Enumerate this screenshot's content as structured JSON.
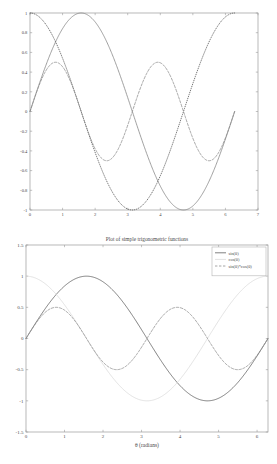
{
  "chart_data": [
    {
      "id": "top-plot",
      "type": "line",
      "title": "",
      "xlabel": "",
      "ylabel": "",
      "xlim": [
        0,
        7
      ],
      "ylim": [
        -1,
        1
      ],
      "xticks": [
        "0",
        "1",
        "2",
        "3",
        "4",
        "5",
        "6",
        "7"
      ],
      "xtick_values": [
        0,
        1,
        2,
        3,
        4,
        5,
        6,
        7
      ],
      "yticks": [
        "1",
        "0.8",
        "0.6",
        "0.4",
        "0.2",
        "0",
        "-0.2",
        "-0.4",
        "-0.6",
        "-0.8",
        "-1"
      ],
      "ytick_values": [
        1,
        0.8,
        0.6,
        0.4,
        0.2,
        0,
        -0.2,
        -0.4,
        -0.6,
        -0.8,
        -1
      ],
      "grid": false,
      "legend": false,
      "x_domain_data": [
        0,
        6.2832
      ],
      "series": [
        {
          "name": "sin(theta)",
          "style": "solid",
          "color": "#808080",
          "expression": "sin(x)",
          "amplitude": 1,
          "samples_x": [
            0,
            0.3927,
            0.7854,
            1.1781,
            1.5708,
            1.9635,
            2.3562,
            2.7489,
            3.1416,
            3.5343,
            3.927,
            4.3197,
            4.7124,
            5.1051,
            5.4978,
            5.8905,
            6.2832
          ],
          "samples_y": [
            0,
            0.3827,
            0.7071,
            0.9239,
            1,
            0.9239,
            0.7071,
            0.3827,
            0,
            -0.3827,
            -0.7071,
            -0.9239,
            -1,
            -0.9239,
            -0.7071,
            -0.3827,
            0
          ]
        },
        {
          "name": "cos(theta)",
          "style": "dotted",
          "color": "#4a4a4a",
          "expression": "cos(x)",
          "amplitude": 1,
          "samples_x": [
            0,
            0.3927,
            0.7854,
            1.1781,
            1.5708,
            1.9635,
            2.3562,
            2.7489,
            3.1416,
            3.5343,
            3.927,
            4.3197,
            4.7124,
            5.1051,
            5.4978,
            5.8905,
            6.2832
          ],
          "samples_y": [
            1,
            0.9239,
            0.7071,
            0.3827,
            0,
            -0.3827,
            -0.7071,
            -0.9239,
            -1,
            -0.9239,
            -0.7071,
            -0.3827,
            0,
            0.3827,
            0.7071,
            0.9239,
            1
          ]
        },
        {
          "name": "sin(theta)*cos(theta)",
          "style": "dashed",
          "color": "#888888",
          "expression": "sin(x)*cos(x)",
          "amplitude": 0.5,
          "samples_x": [
            0,
            0.3927,
            0.7854,
            1.1781,
            1.5708,
            1.9635,
            2.3562,
            2.7489,
            3.1416,
            3.5343,
            3.927,
            4.3197,
            4.7124,
            5.1051,
            5.4978,
            5.8905,
            6.2832
          ],
          "samples_y": [
            0,
            0.3536,
            0.5,
            0.3536,
            0,
            -0.3536,
            -0.5,
            -0.3536,
            0,
            0.3536,
            0.5,
            0.3536,
            0,
            -0.3536,
            -0.5,
            -0.3536,
            0
          ]
        }
      ]
    },
    {
      "id": "bottom-plot",
      "type": "line",
      "title": "Plot of simple trigonometric functions",
      "xlabel": "θ (radians)",
      "ylabel": "",
      "xlim": [
        0,
        6.2832
      ],
      "ylim": [
        -1.5,
        1.5
      ],
      "xticks": [
        "0",
        "1",
        "2",
        "3",
        "4",
        "5",
        "6"
      ],
      "xtick_values": [
        0,
        1,
        2,
        3,
        4,
        5,
        6
      ],
      "yticks": [
        "1.5",
        "1",
        "0.5",
        "0",
        "-0.5",
        "-1",
        "-1.5"
      ],
      "ytick_values": [
        1.5,
        1,
        0.5,
        0,
        -0.5,
        -1,
        -1.5
      ],
      "grid": false,
      "legend": true,
      "legend_position": "upper right",
      "x_domain_data": [
        0,
        6.2832
      ],
      "series": [
        {
          "name": "sin(θ)",
          "style": "solid",
          "color": "#555555",
          "expression": "sin(x)",
          "amplitude": 1,
          "samples_x": [
            0,
            0.3927,
            0.7854,
            1.1781,
            1.5708,
            1.9635,
            2.3562,
            2.7489,
            3.1416,
            3.5343,
            3.927,
            4.3197,
            4.7124,
            5.1051,
            5.4978,
            5.8905,
            6.2832
          ],
          "samples_y": [
            0,
            0.3827,
            0.7071,
            0.9239,
            1,
            0.9239,
            0.7071,
            0.3827,
            0,
            -0.3827,
            -0.7071,
            -0.9239,
            -1,
            -0.9239,
            -0.7071,
            -0.3827,
            0
          ]
        },
        {
          "name": "cos(θ)",
          "style": "solid",
          "color": "#d8d8d8",
          "expression": "cos(x)",
          "amplitude": 1,
          "samples_x": [
            0,
            0.3927,
            0.7854,
            1.1781,
            1.5708,
            1.9635,
            2.3562,
            2.7489,
            3.1416,
            3.5343,
            3.927,
            4.3197,
            4.7124,
            5.1051,
            5.4978,
            5.8905,
            6.2832
          ],
          "samples_y": [
            1,
            0.9239,
            0.7071,
            0.3827,
            0,
            -0.3827,
            -0.7071,
            -0.9239,
            -1,
            -0.9239,
            -0.7071,
            -0.3827,
            0,
            0.3827,
            0.7071,
            0.9239,
            1
          ]
        },
        {
          "name": "sin(θ)*cos(θ)",
          "style": "dashed",
          "color": "#8a8a8a",
          "expression": "sin(x)*cos(x)",
          "amplitude": 0.5,
          "samples_x": [
            0,
            0.3927,
            0.7854,
            1.1781,
            1.5708,
            1.9635,
            2.3562,
            2.7489,
            3.1416,
            3.5343,
            3.927,
            4.3197,
            4.7124,
            5.1051,
            5.4978,
            5.8905,
            6.2832
          ],
          "samples_y": [
            0,
            0.3536,
            0.5,
            0.3536,
            0,
            -0.3536,
            -0.5,
            -0.3536,
            0,
            0.3536,
            0.5,
            0.3536,
            0,
            -0.3536,
            -0.5,
            -0.3536,
            0
          ]
        }
      ]
    }
  ],
  "colors": {
    "background": "#ffffff",
    "frame": "#9a9a9a",
    "text": "#4a4a4a"
  }
}
